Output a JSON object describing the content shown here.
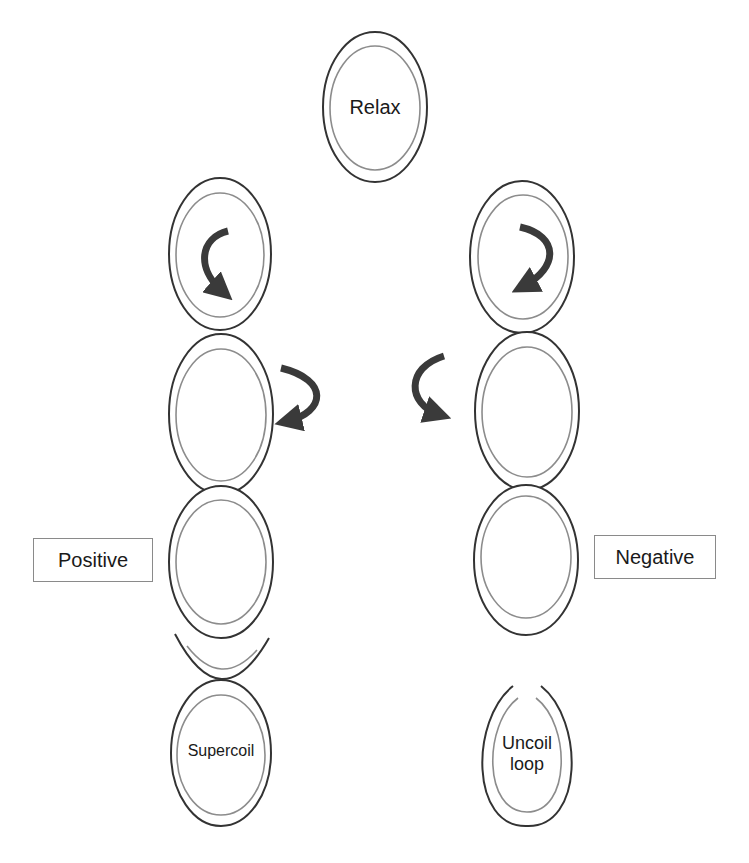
{
  "labels": {
    "relax": "Relax",
    "positive": "Positive",
    "negative": "Negative",
    "supercoil": "Supercoil",
    "uncoil_line1": "Uncoil",
    "uncoil_line2": "loop"
  },
  "colors": {
    "outer_stroke": "#333333",
    "inner_stroke": "#8c8c8c",
    "arrow": "#3a3a3a",
    "box_border": "#8a8a8a",
    "background": "#ffffff"
  },
  "nodes": {
    "relax": {
      "cx": 375,
      "cy": 107,
      "rx": 52,
      "ry": 75
    },
    "left_column": [
      {
        "cx": 220,
        "cy": 254,
        "rx": 51,
        "ry": 76,
        "arrow": "clockwise-inner"
      },
      {
        "cx": 221,
        "cy": 414,
        "rx": 52,
        "ry": 80,
        "arrow": "clockwise-outer-right"
      },
      {
        "cx": 221,
        "cy": 562,
        "rx": 52,
        "ry": 76
      },
      {
        "type": "cup",
        "cx": 221,
        "y_top": 633,
        "y_bottom": 683
      },
      {
        "cx": 221,
        "cy": 753,
        "rx": 50,
        "ry": 73,
        "label": "Supercoil"
      }
    ],
    "right_column": [
      {
        "cx": 522,
        "cy": 257,
        "rx": 52,
        "ry": 76,
        "arrow": "counterclockwise-inner"
      },
      {
        "cx": 527,
        "cy": 411,
        "rx": 52,
        "ry": 79,
        "arrow": "counterclockwise-outer-left"
      },
      {
        "cx": 526,
        "cy": 560,
        "rx": 52,
        "ry": 75
      },
      {
        "cx": 527,
        "cy": 755,
        "rx": 47,
        "ry": 70,
        "type": "open-loop",
        "label": "Uncoil loop"
      }
    ]
  }
}
